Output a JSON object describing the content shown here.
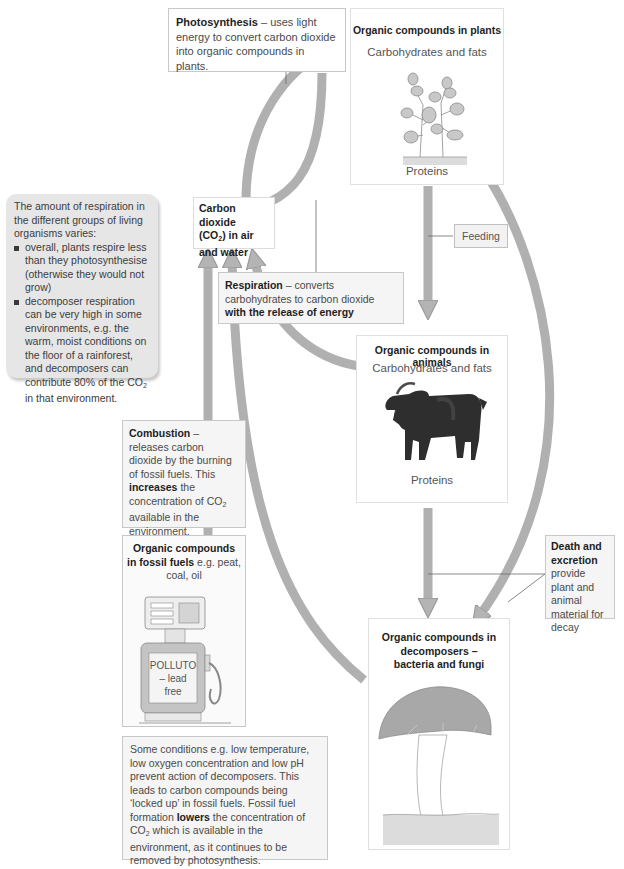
{
  "colors": {
    "arrow_fill": "#b4b4b4",
    "arrow_stroke": "#9a9a9a",
    "box_border": "#c8c8c8",
    "shaded_panel": "#e6e6e6",
    "text": "#4a4a4a",
    "bold_text": "#1e1e1e"
  },
  "photosynthesis": {
    "term": "Photosynthesis",
    "desc": " – uses light energy to convert carbon dioxide into organic compounds in plants."
  },
  "plants": {
    "title": "Organic compounds in plants",
    "carbs": "Carbohydrates and fats",
    "proteins": "Proteins",
    "image": "plant-illustration"
  },
  "co2": {
    "line1": "Carbon dioxide",
    "line2_pre": "(CO",
    "line2_sub": "2",
    "line2_post": ") in air",
    "line3": "and water"
  },
  "respiration_note": {
    "intro": "The amount of respiration in the different groups of living organisms varies:",
    "bullets": [
      "overall, plants respire less than they photosynthesise (otherwise they would not grow)",
      "decomposer respiration can be very high in some environments, e.g. the warm, moist conditions on the floor of a rainforest, and decomposers can contribute 80% of the CO"
    ],
    "bullet2_sub": "2",
    "bullet2_tail": " in that environment."
  },
  "feeding": {
    "label": "Feeding"
  },
  "respiration": {
    "term": "Respiration",
    "desc": " – converts carbohydrates to carbon dioxide ",
    "bold_tail": "with the release of energy"
  },
  "animals": {
    "title": "Organic compounds in animals",
    "carbs": "Carbohydrates and fats",
    "proteins": "Proteins",
    "image": "goat-illustration"
  },
  "combustion": {
    "term": "Combustion",
    "desc1": " – releases carbon dioxide by the burning of fossil fuels. This ",
    "bold": "increases",
    "desc2": " the concentration of CO",
    "sub": "2",
    "desc3": " available in the environment."
  },
  "fossil": {
    "title_bold": "Organic compounds in fossil fuels",
    "title_rest": " e.g. peat, coal, oil",
    "pump_label": [
      "POLLUTO",
      "– lead",
      "free"
    ],
    "image": "fuel-pump-illustration"
  },
  "death": {
    "bold": "Death and excretion",
    "desc": " provide plant and animal material for decay"
  },
  "decomposers": {
    "title": "Organic compounds in decomposers – bacteria and fungi",
    "image": "mushroom-illustration"
  },
  "conditions": {
    "text1": "Some conditions e.g. low temperature, low oxygen concentration and low pH prevent action of decomposers. This leads to carbon compounds being ‘locked up’ in fossil fuels. Fossil fuel formation ",
    "bold": "lowers",
    "text2": " the concentration of CO",
    "sub": "2",
    "text3": " which is available in the environment, as it continues to be removed by photosynthesis."
  }
}
